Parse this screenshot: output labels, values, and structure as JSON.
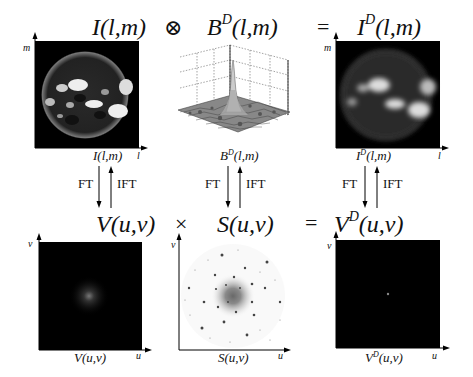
{
  "top_row": {
    "term1": {
      "base": "I",
      "sup": "",
      "args": "(l,m)"
    },
    "op1": "⊗",
    "term2": {
      "base": "B",
      "sup": "D",
      "args": "(l,m)"
    },
    "op2": "=",
    "term3": {
      "base": "I",
      "sup": "D",
      "args": "(l,m)"
    }
  },
  "bottom_row": {
    "term1": {
      "base": "V",
      "sup": "",
      "args": "(u,v)"
    },
    "op1": "×",
    "term2": {
      "base": "S",
      "sup": "",
      "args": "(u,v)"
    },
    "op2": "=",
    "term3": {
      "base": "V",
      "sup": "D",
      "args": "(u,v)"
    }
  },
  "panels": {
    "sky_image": {
      "caption_base": "I",
      "caption_sup": "",
      "caption_args": "(l,m)",
      "x_axis": "l",
      "y_axis": "m",
      "icon": "sun-image-icon"
    },
    "dirty_beam": {
      "caption_base": "B",
      "caption_sup": "D",
      "caption_args": "(l,m)",
      "icon": "3d-surface-plot-icon"
    },
    "dirty_image": {
      "caption_base": "I",
      "caption_sup": "D",
      "caption_args": "(l,m)",
      "x_axis": "l",
      "y_axis": "m",
      "icon": "blurred-sun-image-icon"
    },
    "visibility": {
      "caption_base": "V",
      "caption_sup": "",
      "caption_args": "(u,v)",
      "x_axis": "u",
      "y_axis": "v",
      "icon": "visibility-spectrum-icon"
    },
    "sampling": {
      "caption_base": "S",
      "caption_sup": "",
      "caption_args": "(u,v)",
      "x_axis": "u",
      "y_axis": "v",
      "icon": "uv-sampling-scatter-icon"
    },
    "dirty_visibility": {
      "caption_base": "V",
      "caption_sup": "D",
      "caption_args": "(u,v)",
      "x_axis": "u",
      "y_axis": "v",
      "icon": "sampled-visibility-icon"
    }
  },
  "transforms": {
    "forward": "FT",
    "inverse": "IFT"
  },
  "colors": {
    "background": "#ffffff",
    "panel": "#000000",
    "text": "#111111"
  }
}
